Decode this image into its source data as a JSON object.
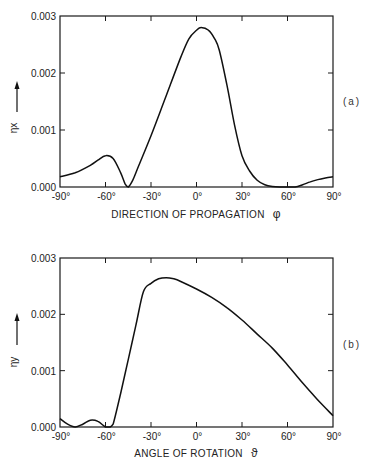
{
  "chart_data": [
    {
      "type": "line",
      "panel_label": "(a)",
      "xlabel": "DIRECTION OF PROPAGATION",
      "xlabel_symbol": "φ",
      "ylabel": "ηx",
      "xlim": [
        -90,
        90
      ],
      "ylim": [
        0,
        0.003
      ],
      "x_ticks": [
        "-90°",
        "-60°",
        "-30°",
        "0°",
        "30°",
        "60°",
        "90°"
      ],
      "y_ticks": [
        "0.000",
        "0.001",
        "0.002",
        "0.003"
      ],
      "grid": false,
      "series": [
        {
          "name": "ηx",
          "x": [
            -90,
            -80,
            -70,
            -65,
            -60,
            -55,
            -50,
            -47,
            -45,
            -42,
            -38,
            -30,
            -20,
            -10,
            -5,
            0,
            3,
            8,
            12,
            15,
            20,
            25,
            30,
            35,
            40,
            45,
            50,
            55,
            60,
            65,
            70,
            75,
            80,
            85,
            90
          ],
          "y": [
            0.00018,
            0.00025,
            0.00038,
            0.00047,
            0.00055,
            0.0005,
            0.00025,
            5e-05,
            0.0,
            0.00012,
            0.00038,
            0.0009,
            0.0016,
            0.0023,
            0.0026,
            0.00275,
            0.0028,
            0.00275,
            0.0026,
            0.0024,
            0.0018,
            0.0011,
            0.00055,
            0.00028,
            0.00012,
            4e-05,
            1e-05,
            0.0,
            0.0,
            0.0,
            4e-05,
            9e-05,
            0.00013,
            0.00016,
            0.00018
          ]
        }
      ]
    },
    {
      "type": "line",
      "panel_label": "(b)",
      "xlabel": "ANGLE OF ROTATION",
      "xlabel_symbol": "ϑ",
      "ylabel": "ηy",
      "xlim": [
        -90,
        90
      ],
      "ylim": [
        0,
        0.003
      ],
      "x_ticks": [
        "-90°",
        "-60°",
        "-30°",
        "0°",
        "30°",
        "60°",
        "90°"
      ],
      "y_ticks": [
        "0.000",
        "0.001",
        "0.002",
        "0.003"
      ],
      "grid": false,
      "series": [
        {
          "name": "ηy",
          "x": [
            -90,
            -85,
            -80,
            -75,
            -70,
            -65,
            -60,
            -57,
            -55,
            -50,
            -45,
            -40,
            -35,
            -30,
            -25,
            -20,
            -15,
            -10,
            0,
            10,
            20,
            30,
            40,
            50,
            60,
            70,
            80,
            90
          ],
          "y": [
            0.00015,
            5e-05,
            0.0,
            5e-05,
            0.00012,
            0.0001,
            0.0,
            0.0,
            5e-05,
            0.0006,
            0.0012,
            0.0018,
            0.0024,
            0.00255,
            0.00263,
            0.00265,
            0.00263,
            0.00258,
            0.00245,
            0.0023,
            0.00212,
            0.0019,
            0.00165,
            0.0014,
            0.0011,
            0.00078,
            0.00048,
            0.0002
          ]
        }
      ]
    }
  ],
  "panels": {
    "a": {
      "label": "(a)",
      "ylabel": "ηx",
      "xlabel": "DIRECTION OF PROPAGATION",
      "xsym": "φ",
      "xticks": [
        "-90°",
        "-60°",
        "-30°",
        "0°",
        "30°",
        "60°",
        "90°"
      ],
      "yticks": [
        "0.000",
        "0.001",
        "0.002",
        "0.003"
      ]
    },
    "b": {
      "label": "(b)",
      "ylabel": "ηy",
      "xlabel": "ANGLE OF ROTATION",
      "xsym": "ϑ",
      "xticks": [
        "-90°",
        "-60°",
        "-30°",
        "0°",
        "30°",
        "60°",
        "90°"
      ],
      "yticks": [
        "0.000",
        "0.001",
        "0.002",
        "0.003"
      ]
    }
  }
}
